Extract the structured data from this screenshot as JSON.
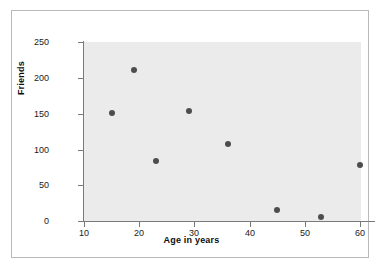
{
  "chart_data": {
    "type": "scatter",
    "title": "",
    "xlabel": "Age in years",
    "ylabel": "Friends",
    "xlim": [
      10,
      62
    ],
    "ylim": [
      0,
      250
    ],
    "xticks": [
      10,
      20,
      30,
      40,
      50,
      60
    ],
    "yticks": [
      0,
      50,
      100,
      150,
      200,
      250
    ],
    "grid": false,
    "legend": null,
    "point_color": "#4d4d4d",
    "panel_color": "#ebebeb",
    "axis_color": "#7a7a7a",
    "points": [
      {
        "x": 15,
        "y": 151
      },
      {
        "x": 19,
        "y": 211
      },
      {
        "x": 23,
        "y": 84
      },
      {
        "x": 29,
        "y": 153
      },
      {
        "x": 36,
        "y": 107
      },
      {
        "x": 45,
        "y": 15
      },
      {
        "x": 53,
        "y": 6
      },
      {
        "x": 60,
        "y": 78
      }
    ],
    "xtick_labels": [
      "10",
      "20",
      "30",
      "40",
      "50",
      "60"
    ],
    "ytick_labels": [
      "0",
      "50",
      "100",
      "150",
      "200",
      "250"
    ]
  }
}
